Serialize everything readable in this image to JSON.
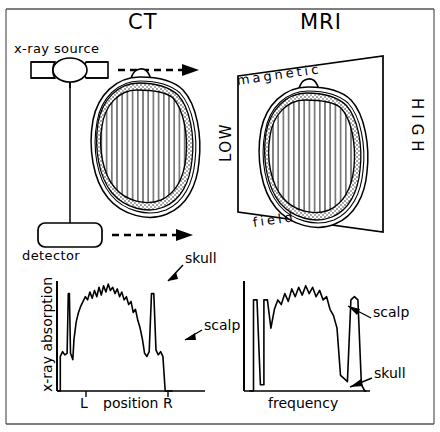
{
  "figure": {
    "panels": {
      "ct": {
        "title": "CT",
        "source_label": "x-ray source",
        "detector_label": "detector"
      },
      "mri": {
        "title": "MRI",
        "plane_top_label": "magnetic",
        "plane_bottom_label": "field",
        "plane_left_label": "LOW",
        "plane_right_label": "HIGH"
      }
    },
    "charts": [
      {
        "id": "ct-profile",
        "type": "line",
        "title": "",
        "xlabel": "position",
        "ylabel": "x-ray absorption",
        "xtick_left": "L",
        "xtick_right": "R",
        "annotations": [
          {
            "text": "skull",
            "target": "left-right-skull-peak"
          },
          {
            "text": "scalp",
            "target": "right-scalp-bump"
          }
        ],
        "x": [
          0,
          2,
          2,
          4,
          6,
          8,
          9,
          10,
          11,
          12,
          13,
          14,
          16,
          18,
          20,
          22,
          24,
          26,
          28,
          30,
          32,
          34,
          36,
          38,
          40,
          42,
          44,
          46,
          48,
          50,
          52,
          54,
          56,
          58,
          60,
          62,
          64,
          66,
          68,
          70,
          72,
          74,
          76,
          78,
          80,
          82,
          84,
          86,
          88,
          90,
          92,
          94,
          96,
          98,
          100
        ],
        "values": [
          0,
          0,
          22,
          25,
          23,
          24,
          62,
          62,
          24,
          22,
          20,
          33,
          44,
          50,
          54,
          57,
          60,
          58,
          63,
          59,
          64,
          60,
          66,
          61,
          67,
          63,
          68,
          64,
          66,
          62,
          65,
          60,
          63,
          58,
          60,
          55,
          57,
          50,
          52,
          45,
          40,
          33,
          24,
          22,
          25,
          62,
          62,
          26,
          23,
          25,
          22,
          0,
          0,
          0,
          0
        ],
        "ylim": [
          0,
          70
        ],
        "xlim": [
          0,
          100
        ],
        "grid": false,
        "legend": "none"
      },
      {
        "id": "mri-profile",
        "type": "line",
        "title": "",
        "xlabel": "frequency",
        "ylabel": "",
        "annotations": [
          {
            "text": "scalp",
            "target": "right-scalp-peak"
          },
          {
            "text": "skull",
            "target": "right-skull-valley"
          }
        ],
        "x": [
          0,
          3,
          3,
          6,
          9,
          12,
          12,
          15,
          18,
          21,
          24,
          27,
          30,
          33,
          36,
          39,
          42,
          45,
          48,
          51,
          54,
          57,
          60,
          63,
          66,
          69,
          72,
          75,
          78,
          81,
          84,
          87,
          90,
          93,
          96,
          99,
          100
        ],
        "values": [
          0,
          0,
          58,
          58,
          4,
          4,
          58,
          58,
          40,
          52,
          58,
          55,
          62,
          57,
          65,
          60,
          66,
          61,
          67,
          62,
          66,
          60,
          64,
          58,
          60,
          52,
          48,
          40,
          10,
          8,
          6,
          58,
          60,
          58,
          4,
          0,
          0
        ],
        "ylim": [
          0,
          70
        ],
        "xlim": [
          0,
          100
        ],
        "grid": false,
        "legend": "none"
      }
    ],
    "colors": {
      "ink": "#000000",
      "paper": "#ffffff",
      "hatch": "#3a3a3a",
      "frame": "#555555"
    }
  }
}
